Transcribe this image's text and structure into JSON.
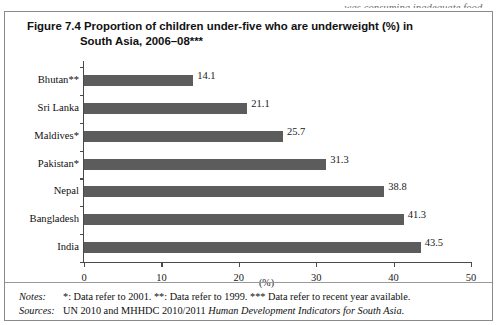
{
  "page": {
    "running_text_above": "was consuming inadequate food."
  },
  "figure": {
    "title_line1": "Figure 7.4 Proportion of children under-five who are underweight (%) in",
    "title_line2": "South Asia, 2006–08***",
    "notes_key": "Notes:",
    "notes_text": "*: Data refer to 2001. **: Data refer to 1999. *** Data refer to recent year available.",
    "sources_key": "Sources:",
    "sources_text_plain": "UN 2010 and MHHDC 2010/2011 ",
    "sources_text_italic": "Human Development Indicators for South Asia."
  },
  "chart_data": {
    "type": "bar",
    "orientation": "horizontal",
    "title": "Figure 7.4 Proportion of children under-five who are underweight (%) in South Asia, 2006–08***",
    "categories": [
      "Bhutan**",
      "Sri Lanka",
      "Maldives*",
      "Pakistan*",
      "Nepal",
      "Bangladesh",
      "India"
    ],
    "values": [
      14.1,
      21.1,
      25.7,
      31.3,
      38.8,
      41.3,
      43.5
    ],
    "value_labels": [
      "14.1",
      "21.1",
      "25.7",
      "31.3",
      "38.8",
      "41.3",
      "43.5"
    ],
    "xlabel": "(%)",
    "ylabel": "",
    "xlim": [
      0,
      50
    ],
    "xticks": [
      0,
      10,
      20,
      30,
      40,
      50
    ],
    "xtick_labels": [
      "0",
      "10",
      "20",
      "30",
      "40",
      "50"
    ],
    "grid": false,
    "legend": false,
    "bar_color": "#5c5c5c",
    "axis_color": "#4a4a4a"
  }
}
